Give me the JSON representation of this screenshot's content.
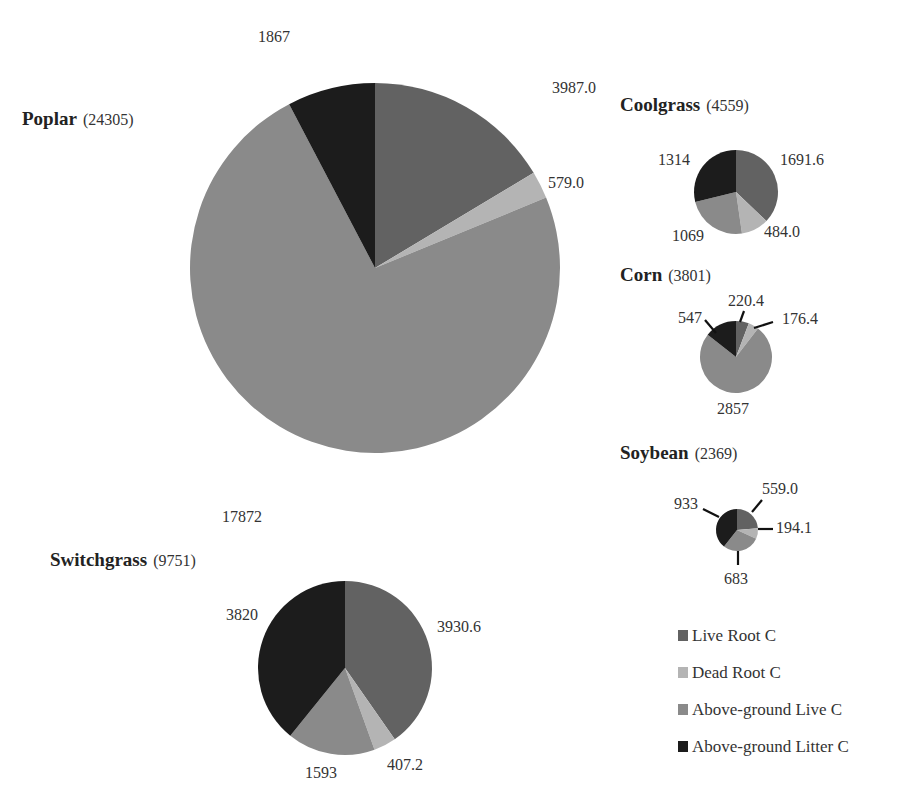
{
  "colors": {
    "Live Root C": "#626262",
    "Dead Root C": "#b4b4b4",
    "Above-ground Live C": "#8a8a8a",
    "Above-ground Litter C": "#1c1c1c"
  },
  "chart_data": {
    "type": "pie",
    "title": "",
    "legend": {
      "position": "right-bottom",
      "entries": [
        "Live Root C",
        "Dead Root C",
        "Above-ground Live C",
        "Above-ground Litter C"
      ]
    },
    "pies": [
      {
        "name": "Poplar",
        "total": 24305,
        "cx": 375,
        "cy": 268,
        "r": 185,
        "slices": [
          {
            "category": "Live Root C",
            "value": 3987.0,
            "label": "3987.0",
            "lx": 552,
            "ly": 93,
            "anchor": "start"
          },
          {
            "category": "Dead Root C",
            "value": 579.0,
            "label": "579.0",
            "lx": 548,
            "ly": 188,
            "anchor": "start"
          },
          {
            "category": "Above-ground Live C",
            "value": 17872,
            "label": "17872",
            "lx": 222,
            "ly": 522,
            "anchor": "start"
          },
          {
            "category": "Above-ground Litter C",
            "value": 1867,
            "label": "1867",
            "lx": 258,
            "ly": 42,
            "anchor": "start"
          }
        ]
      },
      {
        "name": "Coolgrass",
        "total": 4559,
        "cx": 736,
        "cy": 192,
        "r": 42,
        "slices": [
          {
            "category": "Live Root C",
            "value": 1691.6,
            "label": "1691.6",
            "lx": 780,
            "ly": 165,
            "anchor": "start"
          },
          {
            "category": "Dead Root C",
            "value": 484.0,
            "label": "484.0",
            "lx": 764,
            "ly": 237,
            "anchor": "start"
          },
          {
            "category": "Above-ground Live C",
            "value": 1069,
            "label": "1069",
            "lx": 672,
            "ly": 241,
            "anchor": "start"
          },
          {
            "category": "Above-ground Litter C",
            "value": 1314,
            "label": "1314",
            "lx": 658,
            "ly": 165,
            "anchor": "start"
          }
        ]
      },
      {
        "name": "Corn",
        "total": 3801,
        "cx": 736,
        "cy": 357,
        "r": 36,
        "slices": [
          {
            "category": "Live Root C",
            "value": 220.4,
            "label": "220.4",
            "lx": 728,
            "ly": 306,
            "anchor": "start"
          },
          {
            "category": "Dead Root C",
            "value": 176.4,
            "label": "176.4",
            "lx": 782,
            "ly": 324,
            "anchor": "start"
          },
          {
            "category": "Above-ground Live C",
            "value": 2857,
            "label": "2857",
            "lx": 717,
            "ly": 414,
            "anchor": "start"
          },
          {
            "category": "Above-ground Litter C",
            "value": 547,
            "label": "547",
            "lx": 678,
            "ly": 323,
            "anchor": "start"
          }
        ]
      },
      {
        "name": "Soybean",
        "total": 2369,
        "cx": 737,
        "cy": 530,
        "r": 21,
        "slices": [
          {
            "category": "Live Root C",
            "value": 559.0,
            "label": "559.0",
            "lx": 762,
            "ly": 494,
            "anchor": "start"
          },
          {
            "category": "Dead Root C",
            "value": 194.1,
            "label": "194.1",
            "lx": 776,
            "ly": 533,
            "anchor": "start"
          },
          {
            "category": "Above-ground Live C",
            "value": 683,
            "label": "683",
            "lx": 724,
            "ly": 584,
            "anchor": "start"
          },
          {
            "category": "Above-ground Litter C",
            "value": 933,
            "label": "933",
            "lx": 674,
            "ly": 509,
            "anchor": "start"
          }
        ]
      },
      {
        "name": "Switchgrass",
        "total": 9751,
        "cx": 345,
        "cy": 668,
        "r": 87,
        "slices": [
          {
            "category": "Live Root C",
            "value": 3930.6,
            "label": "3930.6",
            "lx": 437,
            "ly": 632,
            "anchor": "start"
          },
          {
            "category": "Dead Root C",
            "value": 407.2,
            "label": "407.2",
            "lx": 387,
            "ly": 770,
            "anchor": "start"
          },
          {
            "category": "Above-ground Live C",
            "value": 1593,
            "label": "1593",
            "lx": 305,
            "ly": 778,
            "anchor": "start"
          },
          {
            "category": "Above-ground Litter C",
            "value": 3820,
            "label": "3820",
            "lx": 226,
            "ly": 620,
            "anchor": "start"
          }
        ]
      }
    ],
    "titles": [
      {
        "pie": "Poplar",
        "x": 22,
        "y": 125
      },
      {
        "pie": "Coolgrass",
        "x": 620,
        "y": 111
      },
      {
        "pie": "Corn",
        "x": 620,
        "y": 281
      },
      {
        "pie": "Soybean",
        "x": 620,
        "y": 459
      },
      {
        "pie": "Switchgrass",
        "x": 50,
        "y": 566
      }
    ],
    "leader_lines": [
      {
        "pie": "Corn",
        "x1": 705,
        "y1": 320,
        "x2": 716,
        "y2": 333
      },
      {
        "pie": "Corn",
        "x1": 744,
        "y1": 311,
        "x2": 740,
        "y2": 322
      },
      {
        "pie": "Corn",
        "x1": 773,
        "y1": 322,
        "x2": 754,
        "y2": 328
      },
      {
        "pie": "Soybean",
        "x1": 703,
        "y1": 509,
        "x2": 719,
        "y2": 517
      },
      {
        "pie": "Soybean",
        "x1": 762,
        "y1": 500,
        "x2": 752,
        "y2": 512
      },
      {
        "pie": "Soybean",
        "x1": 758,
        "y1": 529,
        "x2": 773,
        "y2": 529
      },
      {
        "pie": "Soybean",
        "x1": 738,
        "y1": 551,
        "x2": 738,
        "y2": 565
      }
    ]
  }
}
